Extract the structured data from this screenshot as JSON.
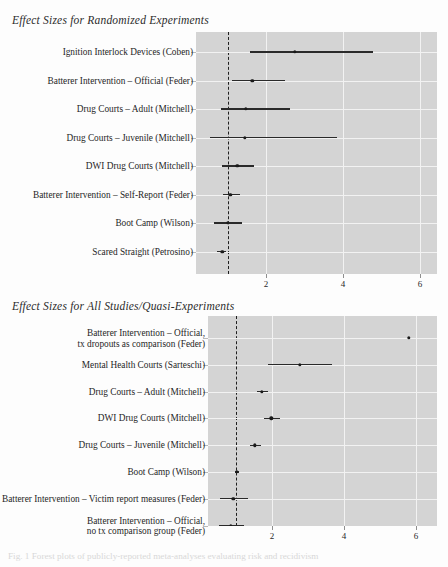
{
  "figure": {
    "caption": "Fig. 1 Forest plots of publicly-reported meta-analyses evaluating risk and recidivism"
  },
  "chart_data": [
    {
      "type": "scatter",
      "title": "Effect Sizes for Randomized Experiments",
      "xlabel": "",
      "ylabel": "",
      "xlim": [
        0.25,
        6.6
      ],
      "xticks": [
        2,
        4,
        6
      ],
      "xtick_labels": [
        "2",
        "4",
        "6"
      ],
      "reference_line": 1,
      "grid": true,
      "orientation": "horizontal",
      "categories": [
        "Ignition Interlock Devices (Coben)",
        "Batterer Intervention – Official (Feder)",
        "Drug Courts – Adult (Mitchell)",
        "Drug Courts – Juvenile (Mitchell)",
        "DWI Drug Courts (Mitchell)",
        "Batterer Intervention – Self-Report (Feder)",
        "Boot Camp (Wilson)",
        "Scared Straight (Petrosino)"
      ],
      "values": [
        2.75,
        1.64,
        1.48,
        1.45,
        1.25,
        1.07,
        1.01,
        0.86
      ],
      "ci_low": [
        1.58,
        1.12,
        0.83,
        0.55,
        0.86,
        0.88,
        0.65,
        0.72
      ],
      "ci_high": [
        4.78,
        2.5,
        2.62,
        3.84,
        1.69,
        1.32,
        1.38,
        0.96
      ]
    },
    {
      "type": "scatter",
      "title": "Effect Sizes for All Studies/Quasi-Experiments",
      "xlabel": "",
      "ylabel": "",
      "xlim": [
        0.25,
        6.6
      ],
      "xticks": [
        2,
        4,
        6
      ],
      "xtick_labels": [
        "2",
        "4",
        "6"
      ],
      "reference_line": 1,
      "grid": true,
      "orientation": "horizontal",
      "categories": [
        "Batterer Intervention – Official,\ntx dropouts as comparison (Feder)",
        "Mental Health Courts (Sarteschi)",
        "Drug Courts – Adult (Mitchell)",
        "DWI Drug Courts (Mitchell)",
        "Drug Courts – Juvenile (Mitchell)",
        "Boot Camp (Wilson)",
        "Batterer Intervention – Victim report measures (Feder)",
        "Batterer Intervention – Official,\nno tx comparison group (Feder)"
      ],
      "values": [
        5.8,
        2.78,
        1.72,
        1.98,
        1.53,
        1.02,
        0.93,
        0.86
      ],
      "ci_low": [
        5.8,
        1.9,
        1.57,
        1.78,
        1.38,
        0.96,
        0.56,
        0.52
      ],
      "ci_high": [
        5.8,
        3.67,
        1.9,
        2.22,
        1.7,
        1.09,
        1.33,
        1.23
      ]
    }
  ],
  "panels": [
    {
      "title": "Effect Sizes for Randomized Experiments",
      "axis_labels": [
        "2",
        "4",
        "6"
      ]
    },
    {
      "title": "Effect Sizes for All Studies/Quasi-Experiments",
      "axis_labels": [
        "2",
        "4",
        "6"
      ]
    }
  ]
}
